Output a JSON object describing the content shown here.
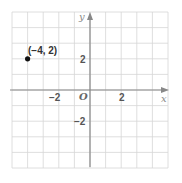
{
  "chart_data": {
    "type": "scatter",
    "title": "",
    "xlabel": "x",
    "ylabel": "y",
    "origin_label": "O",
    "xlim": [
      -5,
      5
    ],
    "ylim": [
      -5,
      5
    ],
    "grid": true,
    "grid_step": 1,
    "x_ticks": [
      {
        "value": -2,
        "label": "−2"
      },
      {
        "value": 2,
        "label": "2"
      }
    ],
    "y_ticks": [
      {
        "value": 2,
        "label": "2"
      },
      {
        "value": -2,
        "label": "−2"
      }
    ],
    "points": [
      {
        "x": -4,
        "y": 2,
        "label": "(−4, 2)"
      }
    ],
    "colors": {
      "grid": "#d6d6d6",
      "axis": "#888888",
      "point": "#111111"
    }
  }
}
